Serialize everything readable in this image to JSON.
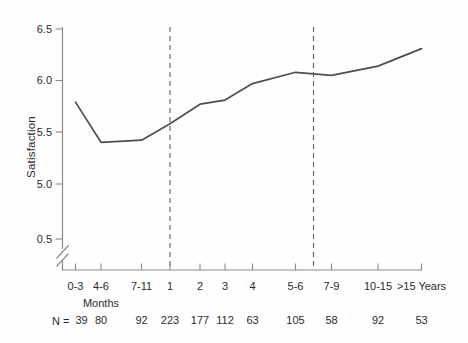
{
  "chart_data": {
    "type": "line",
    "title": "",
    "ylabel": "Satisfaction",
    "x_unit_label": "Months",
    "years_suffix": "Years",
    "categories": [
      "0-3",
      "4-6",
      "7-11",
      "1",
      "2",
      "3",
      "4",
      "5-6",
      "7-9",
      "10-15",
      ">15"
    ],
    "values": [
      5.79,
      5.4,
      5.42,
      5.58,
      5.77,
      5.81,
      5.97,
      6.08,
      6.05,
      6.14,
      6.31
    ],
    "y_ticks": [
      "6.5",
      "6.0",
      "5.5",
      "5.0",
      "0.5"
    ],
    "ylim": [
      0.5,
      6.5
    ],
    "y_axis_break": true,
    "n_label": "N =",
    "n_values": [
      39,
      80,
      92,
      223,
      177,
      112,
      63,
      105,
      58,
      92,
      53
    ],
    "dashed_lines": [
      {
        "at_category": "1"
      },
      {
        "between_categories": [
          "5-6",
          "7-9"
        ]
      }
    ],
    "legend": "none",
    "grid": "off",
    "line_color": "#4e4e4e",
    "axis_color": "#8a8a8a",
    "dash_color": "#5f5f5f",
    "text_color": "#2b2b2b"
  }
}
